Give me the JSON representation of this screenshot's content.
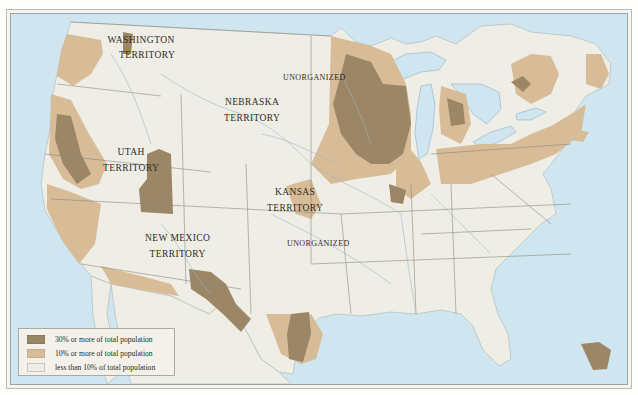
{
  "map": {
    "subject": "Foreign-born population share by county, United States (territorial era)",
    "colors": {
      "water": "#cfe6f1",
      "land": "#efeee6",
      "high": "#9b8666",
      "medium": "#d8bc98",
      "low": "#efeee6",
      "border": "#8b8a80",
      "river": "#9fb6c4"
    },
    "labels": {
      "washington": [
        "WASHINGTON",
        "TERRITORY"
      ],
      "nebraska": [
        "NEBRASKA",
        "TERRITORY"
      ],
      "unorganized_north": "UNORGANIZED",
      "utah": [
        "UTAH",
        "TERRITORY"
      ],
      "kansas": [
        "KANSAS",
        "TERRITORY"
      ],
      "new_mexico": [
        "NEW MEXICO",
        "TERRITORY"
      ],
      "unorganized_south": "UNORGANIZED"
    }
  },
  "legend": {
    "items": [
      {
        "label": "30% or more of total population",
        "color": "#9b8666"
      },
      {
        "label": "10% or more of total population",
        "color": "#d8bc98"
      },
      {
        "label": "less than 10% of total population",
        "color": "#efeee6"
      }
    ]
  }
}
